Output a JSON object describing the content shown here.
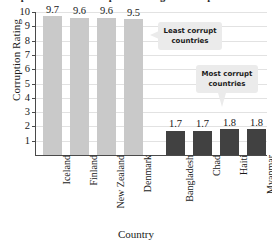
{
  "chart_data": {
    "type": "bar",
    "title": "Reported Data: Corruption Rating of Corrupt Countries",
    "xlabel": "Country",
    "ylabel": "Corruption Rating",
    "ylim": [
      0,
      10
    ],
    "ytick_labels": [
      "10",
      "9",
      "8",
      "7",
      "6",
      "5",
      "4",
      "3",
      "2",
      "1"
    ],
    "yticks": [
      10,
      9,
      8,
      7,
      6,
      5,
      4,
      3,
      2,
      1
    ],
    "grid": true,
    "legend": "none",
    "categories": [
      "Iceland",
      "Finland",
      "New Zealand",
      "Denmark",
      "Bangladesh",
      "Chad",
      "Haiti",
      "Myanmar"
    ],
    "values": [
      9.7,
      9.6,
      9.6,
      9.5,
      1.7,
      1.7,
      1.8,
      1.8
    ],
    "value_labels": [
      "9.7",
      "9.6",
      "9.6",
      "9.5",
      "1.7",
      "1.7",
      "1.8",
      "1.8"
    ],
    "bar_groups": [
      "least",
      "least",
      "least",
      "least",
      "most",
      "most",
      "most",
      "most"
    ],
    "colors": {
      "least_corrupt_bar": "#c9c9c9",
      "most_corrupt_bar": "#414141",
      "gridline": "#e2e2e2",
      "axis": "#4a4a4a",
      "callout_background": "#ebebeb",
      "text": "#1a1a1a"
    },
    "annotations": [
      {
        "name": "least-corrupt-callout",
        "line1": "Least corrupt",
        "line2": "countries",
        "tail": "left"
      },
      {
        "name": "most-corrupt-callout",
        "line1": "Most corrupt",
        "line2": "countries",
        "tail": "down"
      }
    ]
  }
}
